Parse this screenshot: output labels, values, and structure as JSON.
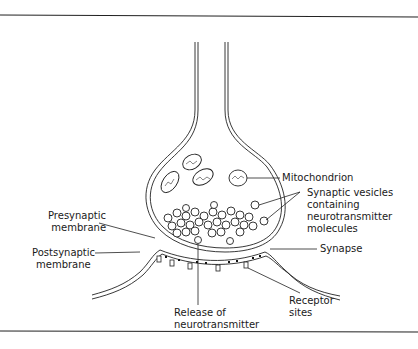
{
  "diagram": {
    "labels": {
      "mitochondrion": "Mitochondrion",
      "vesicles": [
        "Synaptic vesicles",
        "containing",
        "neurotransmitter",
        "molecules"
      ],
      "presynaptic": [
        "Presynaptic",
        "membrane"
      ],
      "postsynaptic": [
        "Postsynaptic",
        "membrane"
      ],
      "synapse": "Synapse",
      "release": [
        "Release of",
        "neurotransmitter"
      ],
      "receptor": [
        "Receptor",
        "sites"
      ]
    },
    "colors": {
      "line": "#1a1a1a",
      "background": "#ffffff"
    }
  }
}
